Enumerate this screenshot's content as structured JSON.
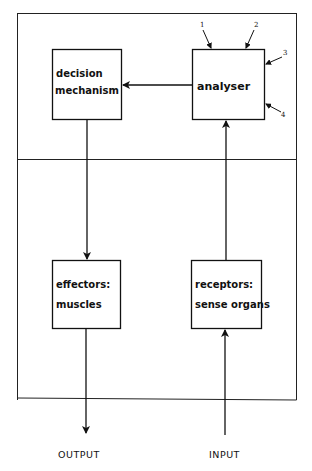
{
  "diagram": {
    "boxes": {
      "decision": {
        "line1": "decision",
        "line2": "mechanism"
      },
      "analyser": {
        "line1": "analyser"
      },
      "effectors": {
        "line1": "effectors:",
        "line2": "muscles"
      },
      "receptors": {
        "line1": "receptors:",
        "line2": "sense organs"
      }
    },
    "input_numbers": [
      "1",
      "2",
      "3",
      "4"
    ],
    "output_label": "OUTPUT",
    "input_label": "INPUT"
  }
}
